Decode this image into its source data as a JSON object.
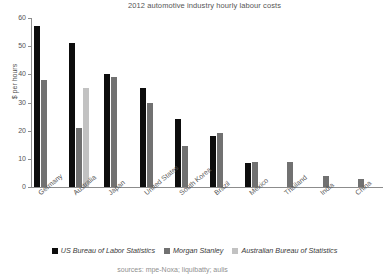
{
  "chart_data": {
    "type": "bar",
    "title": "2012 automotive industry hourly labour costs",
    "xlabel": "",
    "ylabel": "$ per hours",
    "ylim": [
      0,
      60
    ],
    "yticks": [
      0,
      10,
      20,
      30,
      40,
      50,
      60
    ],
    "grid": false,
    "legend_position": "bottom",
    "categories": [
      "Germany",
      "Australia",
      "Japan",
      "United States",
      "South Korea",
      "Brazil",
      "Mexico",
      "Thailand",
      "India",
      "China"
    ],
    "series": [
      {
        "name": "US Bureau of Labor Statistics",
        "color": "#0d0d0d",
        "values": [
          57,
          51,
          40,
          35,
          24,
          18,
          8.5,
          null,
          null,
          null
        ]
      },
      {
        "name": "Morgan Stanley",
        "color": "#717171",
        "values": [
          38,
          21,
          39,
          30,
          14.5,
          19,
          9,
          9,
          4,
          3
        ]
      },
      {
        "name": "Australian Bureau of Statistics",
        "color": "#c2c2c2",
        "values": [
          null,
          35,
          null,
          null,
          null,
          null,
          null,
          null,
          null,
          null
        ]
      }
    ]
  },
  "axis": {
    "y_tick_labels": [
      "60",
      "50",
      "40",
      "30",
      "20",
      "10",
      "0"
    ],
    "y_axis_title": "$ per hours"
  },
  "legend": {
    "items": [
      {
        "label": "US Bureau of Labor Statistics",
        "color": "#0d0d0d"
      },
      {
        "label": "Morgan Stanley",
        "color": "#717171"
      },
      {
        "label": "Australian Bureau of Statistics",
        "color": "#c2c2c2"
      }
    ]
  },
  "footer": {
    "note": "sources: mpe-Noxa; liquibatty; aulis"
  }
}
